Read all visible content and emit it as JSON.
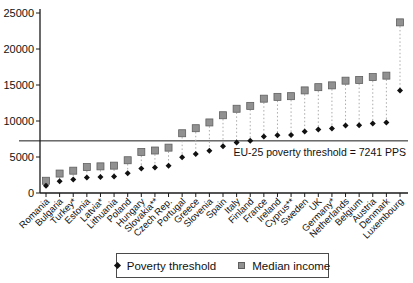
{
  "figure": {
    "background": "#ffffff",
    "axis_color": "#1a1a1a",
    "text_color": "#111111"
  },
  "chart_data": {
    "type": "scatter",
    "title": "",
    "xlabel": "",
    "ylabel": "",
    "ylim": [
      0,
      25000
    ],
    "yticks": [
      0,
      5000,
      10000,
      15000,
      20000,
      25000
    ],
    "grid": false,
    "legend_position": "bottom-center",
    "connector_style": "dotted",
    "categories": [
      "Romania",
      "Bulgaria",
      "Turkey*",
      "Estonia",
      "Latvia*",
      "Lithuania",
      "Poland",
      "Hungary",
      "Slovakia**",
      "Czech Rep.",
      "Portugal",
      "Greece",
      "Slovenia",
      "Spain",
      "Italy",
      "Finland",
      "France",
      "Ireland",
      "Cyprus**",
      "Sweden",
      "UK",
      "Germany*",
      "Netherlands",
      "Belgium",
      "Austria",
      "Denmark",
      "Luxembourg"
    ],
    "series": [
      {
        "name": "Poverty threshold",
        "marker": "diamond",
        "color": "#111111",
        "values": [
          1020,
          1620,
          1860,
          2160,
          2220,
          2280,
          2730,
          3420,
          3540,
          3780,
          4980,
          5400,
          5880,
          6480,
          7020,
          7260,
          7860,
          8010,
          8070,
          8550,
          8820,
          8970,
          9360,
          9420,
          9660,
          9780,
          14220
        ]
      },
      {
        "name": "Median income",
        "marker": "square",
        "color": "#919191",
        "marker_edge_color": "#5f5f5f",
        "values": [
          1700,
          2700,
          3100,
          3600,
          3700,
          3800,
          4550,
          5700,
          5900,
          6300,
          8300,
          9000,
          9800,
          10800,
          11700,
          12100,
          13100,
          13350,
          13450,
          14250,
          14700,
          14950,
          15600,
          15700,
          16100,
          16300,
          23700
        ]
      }
    ],
    "threshold_line": {
      "value": 7241,
      "label": "EU-25 poverty threshold = 7241 PPS",
      "color": "#1a1a1a"
    },
    "connector_color": "#ababab"
  },
  "legend": {
    "items": [
      {
        "label": "Poverty threshold",
        "marker": "diamond",
        "color": "#111111"
      },
      {
        "label": "Median income",
        "marker": "square",
        "color": "#919191"
      }
    ]
  }
}
